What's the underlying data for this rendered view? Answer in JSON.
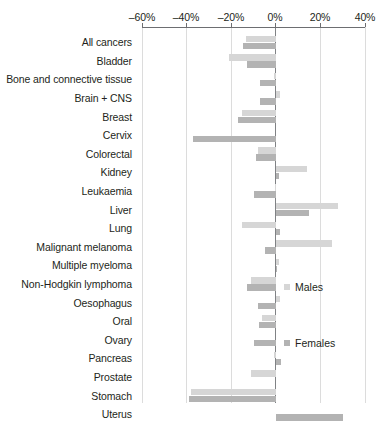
{
  "chart_data": {
    "type": "bar",
    "orientation": "horizontal",
    "title": "",
    "xlabel": "",
    "ylabel": "",
    "xlim": [
      -60,
      40
    ],
    "xticks": [
      -60,
      -40,
      -20,
      0,
      20,
      40
    ],
    "xtick_labels": [
      "–60%",
      "–40%",
      "–20%",
      "0%",
      "20%",
      "40%"
    ],
    "grid": true,
    "legend_position": "inside-right",
    "categories": [
      "All cancers",
      "Bladder",
      "Bone and connective tissue",
      "Brain + CNS",
      "Breast",
      "Cervix",
      "Colorectal",
      "Kidney",
      "Leukaemia",
      "Liver",
      "Lung",
      "Malignant melanoma",
      "Multiple myeloma",
      "Non-Hodgkin lymphoma",
      "Oesophagus",
      "Oral",
      "Ovary",
      "Pancreas",
      "Prostate",
      "Stomach",
      "Uterus"
    ],
    "series": [
      {
        "name": "Males",
        "color": "#d6d6d6",
        "values": [
          -13.5,
          -21.0,
          -1.0,
          2.0,
          -15.0,
          null,
          -8.0,
          14.0,
          -0.5,
          28.0,
          -15.0,
          25.0,
          1.5,
          -11.0,
          2.0,
          -6.0,
          null,
          -1.0,
          -11.0,
          -38.0,
          null
        ]
      },
      {
        "name": "Females",
        "color": "#b3b3b3",
        "values": [
          -14.5,
          -13.0,
          -7.0,
          -7.0,
          -17.0,
          -37.0,
          -9.0,
          1.5,
          -10.0,
          15.0,
          2.0,
          -5.0,
          0.5,
          -13.0,
          -8.0,
          -7.5,
          -10.0,
          2.5,
          null,
          -39.0,
          30.0
        ]
      }
    ]
  },
  "legend": {
    "males_label": "Males",
    "females_label": "Females"
  }
}
